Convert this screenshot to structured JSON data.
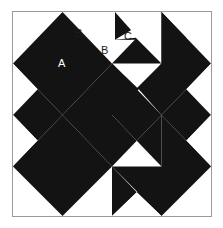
{
  "figure": {
    "width": 223,
    "height": 228
  },
  "block": {
    "name": "pieced-quilt-block",
    "grid_columns": 4,
    "grid_rows": 4,
    "cell_size": 50,
    "frame": {
      "x": 12,
      "y": 11,
      "width": 200,
      "height": 206
    }
  },
  "colors": {
    "dark": "#131313",
    "light": "#ffffff",
    "border": "#9a9a9a",
    "page_background": "#ffffff",
    "label_on_light": "#1a1a1a",
    "label_on_dark": "#ffffff"
  },
  "labels": [
    {
      "id": "label-a",
      "text": "A",
      "x": 45,
      "y": 46,
      "tone": "on-dark"
    },
    {
      "id": "label-b1",
      "text": "B",
      "x": 62,
      "y": 16,
      "tone": "on-light"
    },
    {
      "id": "label-b2",
      "text": "B",
      "x": 88,
      "y": 33,
      "tone": "on-light"
    },
    {
      "id": "label-c",
      "text": "C",
      "x": 111,
      "y": 19,
      "tone": "on-light"
    }
  ],
  "units": [
    {
      "id": "unit-r0c0",
      "row": 0,
      "col": 0,
      "type": "half-diamond-corner-tl",
      "shading": "dark-on-light"
    },
    {
      "id": "unit-r0c1",
      "row": 0,
      "col": 1,
      "type": "half-diamond-corner-tr",
      "shading": "dark-on-light"
    },
    {
      "id": "unit-r0c2",
      "row": 0,
      "col": 2,
      "type": "chevron-down",
      "shading": "dark-on-light"
    },
    {
      "id": "unit-r0c3",
      "row": 0,
      "col": 3,
      "type": "chevron-down",
      "shading": "dark-on-light"
    },
    {
      "id": "unit-r1c0",
      "row": 1,
      "col": 0,
      "type": "chevron-right",
      "shading": "dark-on-light"
    },
    {
      "id": "unit-r1c1",
      "row": 1,
      "col": 1,
      "type": "quarter-center",
      "shading": "dark-on-light"
    },
    {
      "id": "unit-r1c2",
      "row": 1,
      "col": 2,
      "type": "quarter-center",
      "shading": "dark-on-light"
    },
    {
      "id": "unit-r1c3",
      "row": 1,
      "col": 3,
      "type": "chevron-left",
      "shading": "dark-on-light"
    },
    {
      "id": "unit-r2c0",
      "row": 2,
      "col": 0,
      "type": "chevron-right",
      "shading": "dark-on-light"
    },
    {
      "id": "unit-r2c1",
      "row": 2,
      "col": 1,
      "type": "quarter-center",
      "shading": "dark-on-light"
    },
    {
      "id": "unit-r2c2",
      "row": 2,
      "col": 2,
      "type": "quarter-center",
      "shading": "dark-on-light"
    },
    {
      "id": "unit-r2c3",
      "row": 2,
      "col": 3,
      "type": "chevron-left",
      "shading": "dark-on-light"
    },
    {
      "id": "unit-r3c0",
      "row": 3,
      "col": 0,
      "type": "half-diamond-corner-bl",
      "shading": "dark-on-light"
    },
    {
      "id": "unit-r3c1",
      "row": 3,
      "col": 1,
      "type": "chevron-up",
      "shading": "dark-on-light"
    },
    {
      "id": "unit-r3c2",
      "row": 3,
      "col": 2,
      "type": "chevron-up",
      "shading": "dark-on-light"
    },
    {
      "id": "unit-r3c3",
      "row": 3,
      "col": 3,
      "type": "half-diamond-corner-br",
      "shading": "dark-on-light"
    }
  ],
  "legend": {
    "a_description": "A",
    "b_description": "B",
    "c_description": "C"
  }
}
